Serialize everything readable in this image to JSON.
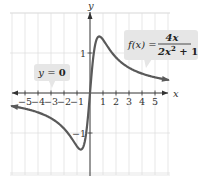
{
  "chart_data": {
    "type": "line",
    "title": "",
    "function_label": {
      "lhs": "f(x) =",
      "numerator": "4x",
      "denominator_base": "2x",
      "denominator_exp": "2",
      "denominator_rest": " + 1"
    },
    "asymptote_label": {
      "lhs": "y = ",
      "value": "0"
    },
    "xlabel": "x",
    "ylabel": "y",
    "xlim": [
      -6,
      6
    ],
    "ylim": [
      -2,
      2
    ],
    "x_ticks": [
      -5,
      -4,
      -3,
      -2,
      -1,
      1,
      2,
      3,
      4,
      5
    ],
    "x_tick_labels": [
      "−5",
      "−4",
      "−3",
      "−2",
      "−1",
      "1",
      "2",
      "3",
      "4",
      "5"
    ],
    "y_ticks": [
      1,
      -1
    ],
    "y_tick_labels": [
      "1",
      "−1"
    ],
    "grid": true,
    "series": [
      {
        "name": "f(x) = 4x/(2x^2+1)",
        "x": [
          -6,
          -5,
          -4,
          -3,
          -2,
          -1,
          -0.707,
          -0.5,
          0,
          0.5,
          0.707,
          1,
          2,
          3,
          4,
          5,
          6
        ],
        "y": [
          -0.329,
          -0.392,
          -0.485,
          -0.632,
          -0.889,
          -1.333,
          -1.414,
          -1.333,
          0,
          1.333,
          1.414,
          1.333,
          0.889,
          0.632,
          0.485,
          0.392,
          0.329
        ]
      }
    ],
    "annotations": [
      {
        "text": "f(x) = 4x / (2x² + 1)",
        "points_to": "curve, right branch"
      },
      {
        "text": "y = 0",
        "points_to": "horizontal asymptote (x-axis)"
      }
    ],
    "colors": {
      "curve": "#5a5a5a",
      "axes": "#333333",
      "grid": "#dcdcdc",
      "callout_bg": "#e6e6e6"
    }
  }
}
